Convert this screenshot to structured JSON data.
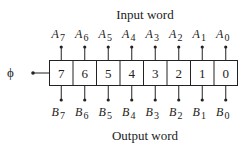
{
  "title_top": "Input word",
  "title_bottom": "Output word",
  "clock_label": "ϕ",
  "cells": [
    "7",
    "6",
    "5",
    "4",
    "3",
    "2",
    "1",
    "0"
  ],
  "inputs": [
    {
      "base": "A",
      "sub": "7"
    },
    {
      "base": "A",
      "sub": "6"
    },
    {
      "base": "A",
      "sub": "5"
    },
    {
      "base": "A",
      "sub": "4"
    },
    {
      "base": "A",
      "sub": "3"
    },
    {
      "base": "A",
      "sub": "2"
    },
    {
      "base": "A",
      "sub": "1"
    },
    {
      "base": "A",
      "sub": "0"
    }
  ],
  "outputs": [
    {
      "base": "B",
      "sub": "7"
    },
    {
      "base": "B",
      "sub": "6"
    },
    {
      "base": "B",
      "sub": "5"
    },
    {
      "base": "B",
      "sub": "4"
    },
    {
      "base": "B",
      "sub": "3"
    },
    {
      "base": "B",
      "sub": "2"
    },
    {
      "base": "B",
      "sub": "1"
    },
    {
      "base": "B",
      "sub": "0"
    }
  ]
}
